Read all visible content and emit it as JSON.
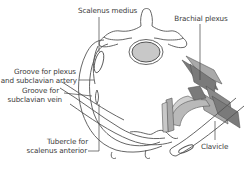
{
  "diagram": {
    "colors": {
      "outline": "#555555",
      "vertebral_body_fill": "#c8c8c8",
      "plexus_dark": "#7a7a7a",
      "plexus_mid": "#a9a9a9",
      "plexus_light": "#d0d0d0",
      "label_text": "#3a3a3a",
      "leader_line": "#444444"
    },
    "labels": [
      {
        "id": "scalenus-medius",
        "text": "Scalenus medius"
      },
      {
        "id": "brachial-plexus",
        "text": "Brachial plexus"
      },
      {
        "id": "groove-plexus-line1",
        "text": "Groove for plexus"
      },
      {
        "id": "groove-plexus-line2",
        "text": "and subclavian artery"
      },
      {
        "id": "groove-vein-line1",
        "text": "Groove for"
      },
      {
        "id": "groove-vein-line2",
        "text": "subclavian vein"
      },
      {
        "id": "tubercle-line1",
        "text": "Tubercle for"
      },
      {
        "id": "tubercle-line2",
        "text": "scalenus anterior"
      },
      {
        "id": "clavicle",
        "text": "Clavicle"
      }
    ]
  }
}
